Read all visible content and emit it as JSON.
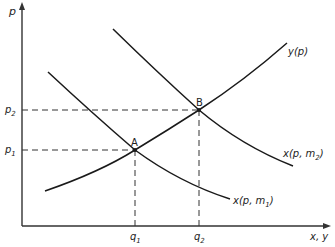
{
  "diagram": {
    "axes": {
      "y_label": "p",
      "x_label": "x, y"
    },
    "curves": {
      "supply": {
        "label": "y(p)"
      },
      "demand_m1": {
        "label": "x(p, m",
        "sub": "1",
        "close": ")"
      },
      "demand_m2": {
        "label": "x(p, m",
        "sub": "2",
        "close": ")"
      }
    },
    "points": {
      "A": {
        "label": "A",
        "price": {
          "label": "p",
          "sub": "1"
        },
        "quantity": {
          "label": "q",
          "sub": "1"
        }
      },
      "B": {
        "label": "B",
        "price": {
          "label": "p",
          "sub": "2"
        },
        "quantity": {
          "label": "q",
          "sub": "2"
        }
      }
    },
    "colors": {
      "line": "#1a1a1a",
      "background": "#ffffff"
    }
  }
}
